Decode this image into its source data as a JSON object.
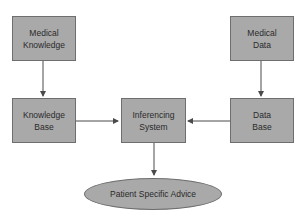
{
  "diagram": {
    "type": "flowchart",
    "colors": {
      "node_fill": "#a9a9a9",
      "node_border": "#6e6e6e",
      "edge": "#4a4a4a",
      "text": "#2a2a2a"
    },
    "nodes": {
      "medical_knowledge": {
        "label": "Medical\nKnowledge",
        "shape": "rect"
      },
      "medical_data": {
        "label": "Medical\nData",
        "shape": "rect"
      },
      "knowledge_base": {
        "label": "Knowledge\nBase",
        "shape": "rect"
      },
      "inferencing_system": {
        "label": "Inferencing\nSystem",
        "shape": "rect"
      },
      "data_base": {
        "label": "Data\nBase",
        "shape": "rect"
      },
      "patient_advice": {
        "label": "Patient Specific Advice",
        "shape": "ellipse"
      }
    },
    "edges": [
      {
        "from": "medical_knowledge",
        "to": "knowledge_base"
      },
      {
        "from": "medical_data",
        "to": "data_base"
      },
      {
        "from": "knowledge_base",
        "to": "inferencing_system"
      },
      {
        "from": "data_base",
        "to": "inferencing_system"
      },
      {
        "from": "inferencing_system",
        "to": "patient_advice"
      }
    ]
  }
}
